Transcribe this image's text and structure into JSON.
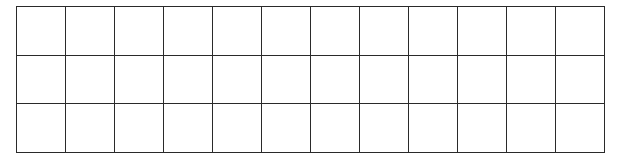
{
  "grid": {
    "rows": 3,
    "columns": 12,
    "cell_width": 49,
    "cell_height": 48.5,
    "line_color": "#2a2a2a",
    "background": "#ffffff",
    "cells": []
  }
}
